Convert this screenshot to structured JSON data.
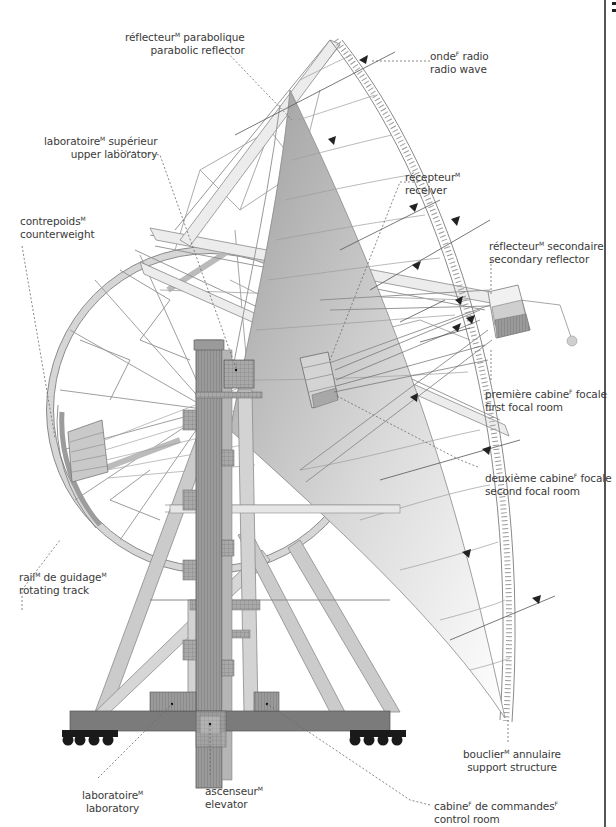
{
  "diagram": {
    "colors": {
      "line": "#7a7a7a",
      "dark_steel": "#6e6e6e",
      "mid_steel": "#b9b9b9",
      "light_steel": "#e2e2e2",
      "dish_shade": "#a8a8a8",
      "leader": "#6a6a6a",
      "wheel": "#1a1a1a",
      "text": "#3a3a3a"
    },
    "labels": [
      {
        "id": "parabolic-reflector",
        "fr": "réflecteur",
        "fr_gender": "M",
        "fr_rest": " parabolique",
        "en": "parabolic reflector"
      },
      {
        "id": "radio-wave",
        "fr": "onde",
        "fr_gender": "F",
        "fr_rest": " radio",
        "en": "radio wave"
      },
      {
        "id": "upper-laboratory",
        "fr": "laboratoire",
        "fr_gender": "M",
        "fr_rest": " supérieur",
        "en": "upper laboratory"
      },
      {
        "id": "receiver",
        "fr": "récepteur",
        "fr_gender": "M",
        "fr_rest": "",
        "en": "receiver"
      },
      {
        "id": "counterweight",
        "fr": "contrepoids",
        "fr_gender": "M",
        "fr_rest": "",
        "en": "counterweight"
      },
      {
        "id": "secondary-reflector",
        "fr": "réflecteur",
        "fr_gender": "M",
        "fr_rest": " secondaire",
        "en": "secondary reflector"
      },
      {
        "id": "first-focal-room",
        "fr": "première cabine",
        "fr_gender": "F",
        "fr_rest": " focale",
        "en": "first focal room"
      },
      {
        "id": "second-focal-room",
        "fr": "deuxième cabine",
        "fr_gender": "F",
        "fr_rest": " focale",
        "en": "second focal room"
      },
      {
        "id": "rotating-track",
        "fr": "rail",
        "fr_gender": "M",
        "fr_rest": " de guidage",
        "fr_gender2": "M",
        "en": "rotating track"
      },
      {
        "id": "support-structure",
        "fr": "bouclier",
        "fr_gender": "M",
        "fr_rest": " annulaire",
        "en": "support structure"
      },
      {
        "id": "laboratory",
        "fr": "laboratoire",
        "fr_gender": "M",
        "fr_rest": "",
        "en": "laboratory"
      },
      {
        "id": "elevator",
        "fr": "ascenseur",
        "fr_gender": "M",
        "fr_rest": "",
        "en": "elevator"
      },
      {
        "id": "control-room",
        "fr": "cabine",
        "fr_gender": "F",
        "fr_rest": " de commandes",
        "fr_gender2": "F",
        "en": "control room"
      }
    ]
  }
}
